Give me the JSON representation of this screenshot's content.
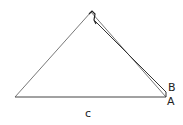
{
  "diagram": {
    "type": "geometry-triangle",
    "labels": {
      "B": "B",
      "A": "A",
      "c": "c"
    },
    "points": {
      "apex": [
        91,
        12
      ],
      "left_base": [
        15,
        97
      ],
      "A": [
        166,
        97
      ],
      "B": [
        166,
        92
      ]
    },
    "stroke_color": "#333333"
  }
}
